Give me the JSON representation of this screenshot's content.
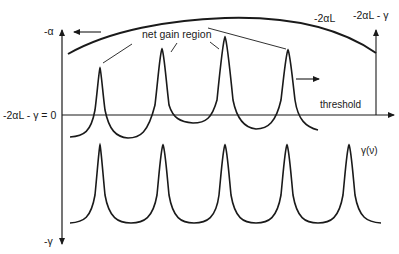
{
  "diagram": {
    "labels": {
      "y_axis_top": "-α",
      "y_axis_bottom": "-γ",
      "threshold_axis_label": "-2αL - γ = 0",
      "gain_curve_label": "-2αL",
      "right_axis_label": "-2αL - γ",
      "net_gain_region": "net gain region",
      "threshold": "threshold",
      "loss_curve_label": "γ(ν)"
    },
    "colors": {
      "stroke": "#1a1a1a",
      "background": "#ffffff"
    },
    "elements": {
      "upper_peaks_count": 4,
      "lower_peaks_count": 5
    }
  }
}
